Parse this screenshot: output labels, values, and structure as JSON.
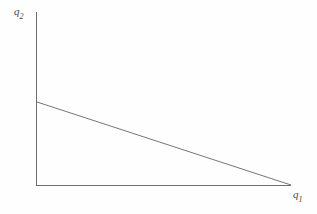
{
  "figure": {
    "background_color": "#fefefe",
    "line_color": "#6e6e6e",
    "axis_color": "#6e6e6e",
    "label_color": "#4a4a4a"
  },
  "axes": {
    "y": {
      "label_base": "q",
      "label_sub": "2",
      "label_full": "q2"
    },
    "x": {
      "label_base": "q",
      "label_sub": "1",
      "label_full": "q1"
    }
  },
  "chart_data": {
    "type": "line",
    "title": "",
    "xlabel": "q1",
    "ylabel": "q2",
    "grid": false,
    "legend": false,
    "axis_style": "two-spine-origin",
    "xlim": [
      0,
      1
    ],
    "ylim": [
      0,
      1
    ],
    "series": [
      {
        "name": "linear frontier",
        "x": [
          0,
          1
        ],
        "y": [
          0.58,
          0
        ],
        "style": "solid",
        "color": "#6e6e6e"
      }
    ],
    "annotations": [],
    "pixel_geometry": {
      "origin": [
        36,
        185
      ],
      "y_axis_top": [
        36,
        12
      ],
      "x_axis_right": [
        291,
        185
      ],
      "line_start": [
        37,
        102
      ],
      "line_end": [
        291,
        185
      ]
    }
  }
}
